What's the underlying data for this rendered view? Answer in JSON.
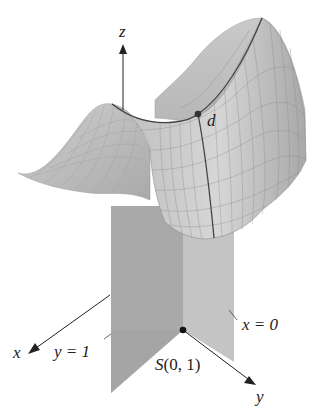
{
  "figure": {
    "type": "3d-surface-diagram"
  },
  "axes": {
    "x_label": "x",
    "y_label": "y",
    "z_label": "z"
  },
  "planes": [
    {
      "name": "y-plane",
      "label": "y = 1",
      "color": "#a9a9a9"
    },
    {
      "name": "x-plane",
      "label": "x = 0",
      "color": "#c4c4c4"
    }
  ],
  "points": {
    "surface_point": {
      "label": "d"
    },
    "base_point": {
      "label_letter": "S",
      "label_coords": "(0, 1)"
    }
  },
  "colors": {
    "surface_light": "#d9d9d9",
    "surface_mid": "#b8b8b8",
    "surface_dark": "#9a9a9a",
    "mesh": "#8c8c8c",
    "curve": "#444444",
    "axis": "#222222"
  }
}
